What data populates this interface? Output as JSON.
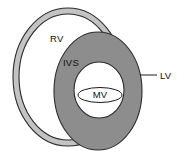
{
  "diagram": {
    "type": "anatomical-cross-section",
    "background_color": "#ffffff",
    "outline_color": "#1a1a1a",
    "labels": {
      "rv": "RV",
      "ivs": "IVS",
      "mv": "MV",
      "lv": "LV"
    },
    "structures": [
      {
        "name": "right-ventricle-ring",
        "label": "RV",
        "fill_color": "#c3c3c3",
        "stroke_color": "#2b2b2b",
        "outer": {
          "cx": 68,
          "cy": 77,
          "rx": 55,
          "ry": 69
        },
        "inner": {
          "cx": 68,
          "cy": 77,
          "rx": 49,
          "ry": 63
        }
      },
      {
        "name": "left-ventricle-wall-ring",
        "label": "LV",
        "fill_color": "#8d8d8d",
        "stroke_color": "#2b2b2b",
        "outer": {
          "cx": 98,
          "cy": 91,
          "rx": 44,
          "ry": 59
        },
        "inner": {
          "cx": 99,
          "cy": 90,
          "rx": 25,
          "ry": 28
        }
      },
      {
        "name": "left-ventricle-cavity",
        "fill_color": "#ffffff",
        "stroke_color": "#2b2b2b"
      },
      {
        "name": "interventricular-septum",
        "label": "IVS",
        "note": "upper-left segment of the left ventricle wall adjoining the right ventricle"
      },
      {
        "name": "mitral-valve",
        "label": "MV",
        "fill_color": "#ffffff",
        "stroke_color": "#1a1a1a",
        "ellipse": {
          "cx": 100,
          "cy": 95,
          "rx": 22,
          "ry": 7.5
        }
      }
    ],
    "leader_lines": [
      {
        "name": "lv-leader-line",
        "label": "LV",
        "from": {
          "x": 140,
          "y": 75
        },
        "to": {
          "x": 157,
          "y": 75
        }
      }
    ],
    "label_positions": {
      "rv": {
        "x": 50,
        "y": 42
      },
      "ivs": {
        "x": 63,
        "y": 66
      },
      "mv": {
        "x": 90,
        "y": 98
      },
      "lv": {
        "x": 160,
        "y": 79
      }
    }
  }
}
